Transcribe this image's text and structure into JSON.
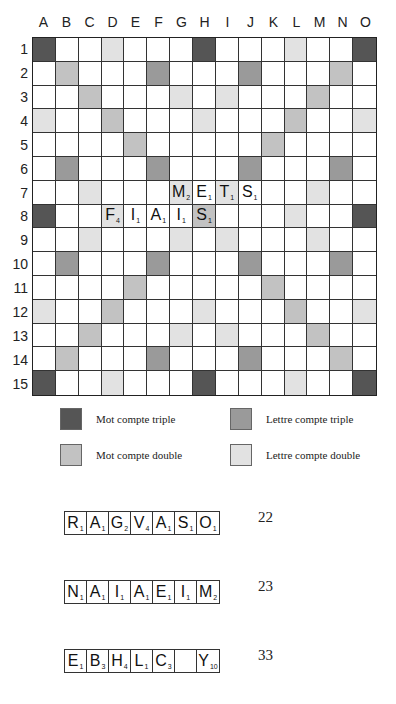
{
  "board": {
    "columns": [
      "A",
      "B",
      "C",
      "D",
      "E",
      "F",
      "G",
      "H",
      "I",
      "J",
      "K",
      "L",
      "M",
      "N",
      "O"
    ],
    "rows": [
      "1",
      "2",
      "3",
      "4",
      "5",
      "6",
      "7",
      "8",
      "9",
      "10",
      "11",
      "12",
      "13",
      "14",
      "15"
    ],
    "premium_colors": {
      "tw": "#555555",
      "tl": "#9a9a9a",
      "dw": "#c2c2c2",
      "dl": "#e2e2e2"
    },
    "premium": {
      "tw": [
        "A1",
        "H1",
        "O1",
        "A8",
        "O8",
        "A15",
        "H15",
        "O15"
      ],
      "dw": [
        "B2",
        "C3",
        "D4",
        "E5",
        "N2",
        "M3",
        "L4",
        "K5",
        "B14",
        "C13",
        "D12",
        "E11",
        "N14",
        "M13",
        "L12",
        "K11",
        "H8"
      ],
      "tl": [
        "F2",
        "J2",
        "B6",
        "F6",
        "J6",
        "N6",
        "B10",
        "F10",
        "J10",
        "N10",
        "F14",
        "J14"
      ],
      "dl": [
        "D1",
        "L1",
        "G3",
        "I3",
        "A4",
        "H4",
        "O4",
        "C7",
        "G7",
        "I7",
        "M7",
        "D8",
        "L8",
        "C9",
        "G9",
        "I9",
        "M9",
        "A12",
        "H12",
        "O12",
        "G13",
        "I13",
        "D15",
        "L15"
      ]
    },
    "tiles": [
      {
        "cell": "G7",
        "letter": "M",
        "value": "2"
      },
      {
        "cell": "H7",
        "letter": "E",
        "value": "1"
      },
      {
        "cell": "I7",
        "letter": "T",
        "value": "1"
      },
      {
        "cell": "J7",
        "letter": "S",
        "value": "1"
      },
      {
        "cell": "D8",
        "letter": "F",
        "value": "4"
      },
      {
        "cell": "E8",
        "letter": "I",
        "value": "1"
      },
      {
        "cell": "F8",
        "letter": "A",
        "value": "1"
      },
      {
        "cell": "G8",
        "letter": "I",
        "value": "1"
      },
      {
        "cell": "H8",
        "letter": "S",
        "value": "1"
      }
    ]
  },
  "legend": [
    {
      "key": "tw",
      "label": "Mot compte triple"
    },
    {
      "key": "tl",
      "label": "Lettre compte triple"
    },
    {
      "key": "dw",
      "label": "Mot compte double"
    },
    {
      "key": "dl",
      "label": "Lettre compte double"
    }
  ],
  "racks": [
    {
      "tiles": [
        {
          "letter": "R",
          "value": "1"
        },
        {
          "letter": "A",
          "value": "1"
        },
        {
          "letter": "G",
          "value": "2"
        },
        {
          "letter": "V",
          "value": "4"
        },
        {
          "letter": "A",
          "value": "1"
        },
        {
          "letter": "S",
          "value": "1"
        },
        {
          "letter": "O",
          "value": "1"
        }
      ],
      "score": "22"
    },
    {
      "tiles": [
        {
          "letter": "N",
          "value": "1"
        },
        {
          "letter": "A",
          "value": "1"
        },
        {
          "letter": "I",
          "value": "1"
        },
        {
          "letter": "A",
          "value": "1"
        },
        {
          "letter": "E",
          "value": "1"
        },
        {
          "letter": "I",
          "value": "1"
        },
        {
          "letter": "M",
          "value": "2"
        }
      ],
      "score": "23"
    },
    {
      "tiles": [
        {
          "letter": "E",
          "value": "1"
        },
        {
          "letter": "B",
          "value": "3"
        },
        {
          "letter": "H",
          "value": "4"
        },
        {
          "letter": "L",
          "value": "1"
        },
        {
          "letter": "C",
          "value": "3"
        },
        {
          "letter": "",
          "value": ""
        },
        {
          "letter": "Y",
          "value": "10"
        }
      ],
      "score": "33"
    }
  ]
}
